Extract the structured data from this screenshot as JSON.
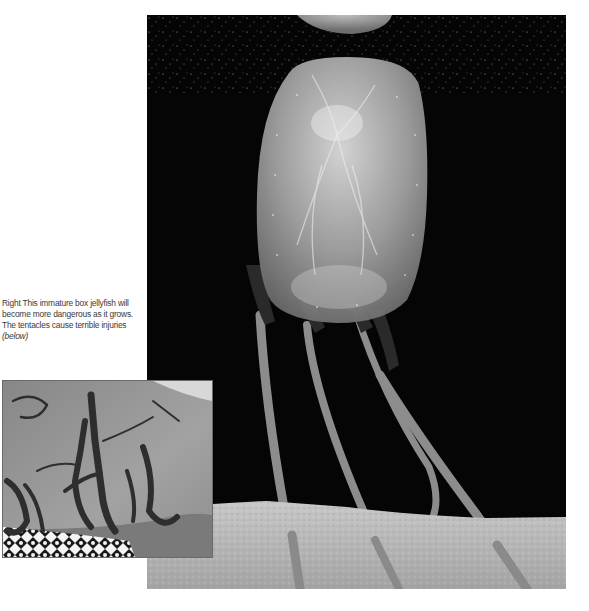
{
  "page": {
    "background": "#ffffff"
  },
  "main_photo": {
    "subject": "immature box jellyfish above sandy floor",
    "background_color": "#050505",
    "sand_color": "#b9b9b9"
  },
  "caption": {
    "lead": "Right",
    "text": " This immature box jellyfish will become more dangerous as it grows. The tentacles cause terrible injuries ",
    "tail": "(below)"
  },
  "inset_photo": {
    "subject": "tentacle sting scars on skin",
    "skin_color": "#9a9a9a",
    "scar_color": "#2e2e2e"
  }
}
